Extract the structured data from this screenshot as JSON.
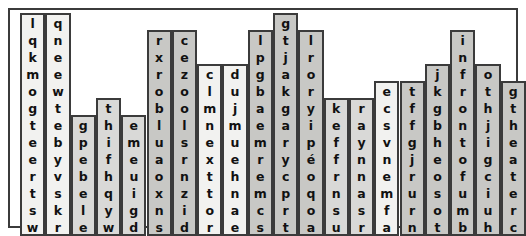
{
  "puzzle": {
    "title": "skyline-word-search",
    "rows": 13,
    "cols": 20,
    "cell_size": 17,
    "border_color": "#3b3b3b",
    "letter_color": "#111111",
    "background": "#ffffff",
    "shades": [
      "#f2f2f0",
      "#d9d9d7",
      "#c8c8c5",
      "#e8e8e6"
    ],
    "hidden_words": [
      "museum",
      "on the corner of",
      "across from",
      "restaurant",
      "in front of",
      "the theater"
    ],
    "columns": [
      {
        "index": 1,
        "top_row": 1,
        "shade": "#f2f2f0",
        "letters": [
          "l",
          "q",
          "k",
          "m",
          "o",
          "g",
          "t",
          "e",
          "e",
          "r",
          "t",
          "s",
          "w"
        ]
      },
      {
        "index": 2,
        "top_row": 1,
        "shade": "#f2f2f0",
        "letters": [
          "q",
          "n",
          "e",
          "e",
          "w",
          "t",
          "e",
          "b",
          "y",
          "v",
          "s",
          "k",
          "r"
        ]
      },
      {
        "index": 3,
        "top_row": 7,
        "shade": "#d9d9d7",
        "letters": [
          "g",
          "p",
          "e",
          "b",
          "e",
          "l",
          "e"
        ]
      },
      {
        "index": 4,
        "top_row": 6,
        "shade": "#d9d9d7",
        "letters": [
          "t",
          "h",
          "i",
          "f",
          "h",
          "q",
          "y",
          "w"
        ]
      },
      {
        "index": 5,
        "top_row": 7,
        "shade": "#d9d9d7",
        "letters": [
          "e",
          "m",
          "e",
          "u",
          "i",
          "g",
          "d"
        ]
      },
      {
        "index": 6,
        "top_row": 2,
        "shade": "#c8c8c5",
        "letters": [
          "r",
          "x",
          "r",
          "o",
          "b",
          "l",
          "u",
          "a",
          "o",
          "x",
          "n",
          "s"
        ]
      },
      {
        "index": 7,
        "top_row": 2,
        "shade": "#c8c8c5",
        "letters": [
          "c",
          "e",
          "z",
          "o",
          "o",
          "l",
          "s",
          "r",
          "n",
          "z",
          "i",
          "d"
        ]
      },
      {
        "index": 8,
        "top_row": 4,
        "shade": "#f2f2f0",
        "letters": [
          "c",
          "l",
          "m",
          "n",
          "e",
          "x",
          "t",
          "t",
          "o",
          "r"
        ]
      },
      {
        "index": 9,
        "top_row": 4,
        "shade": "#f2f2f0",
        "letters": [
          "d",
          "u",
          "j",
          "m",
          "u",
          "e",
          "h",
          "n",
          "a",
          "e"
        ]
      },
      {
        "index": 10,
        "top_row": 2,
        "shade": "#c8c8c5",
        "letters": [
          "l",
          "p",
          "g",
          "b",
          "a",
          "e",
          "m",
          "r",
          "e",
          "m",
          "c",
          "s"
        ]
      },
      {
        "index": 11,
        "top_row": 1,
        "shade": "#c8c8c5",
        "letters": [
          "g",
          "t",
          "j",
          "a",
          "k",
          "g",
          "a",
          "r",
          "y",
          "c",
          "p",
          "r",
          "t"
        ]
      },
      {
        "index": 12,
        "top_row": 2,
        "shade": "#c8c8c5",
        "letters": [
          "l",
          "r",
          "o",
          "r",
          "y",
          "i",
          "p",
          "é",
          "o",
          "q",
          "o",
          "a"
        ]
      },
      {
        "index": 13,
        "top_row": 6,
        "shade": "#d9d9d7",
        "letters": [
          "k",
          "e",
          "f",
          "f",
          "r",
          "n",
          "s",
          "u"
        ]
      },
      {
        "index": 14,
        "top_row": 6,
        "shade": "#d9d9d7",
        "letters": [
          "r",
          "a",
          "y",
          "n",
          "n",
          "a",
          "s",
          "r"
        ]
      },
      {
        "index": 15,
        "top_row": 5,
        "shade": "#f2f2f0",
        "letters": [
          "e",
          "c",
          "s",
          "v",
          "n",
          "e",
          "m",
          "f",
          "a"
        ]
      },
      {
        "index": 16,
        "top_row": 5,
        "shade": "#c8c8c5",
        "letters": [
          "t",
          "f",
          "f",
          "g",
          "j",
          "r",
          "u",
          "r",
          "n"
        ]
      },
      {
        "index": 17,
        "top_row": 4,
        "shade": "#c8c8c5",
        "letters": [
          "j",
          "k",
          "g",
          "b",
          "h",
          "e",
          "o",
          "s",
          "o",
          "t"
        ]
      },
      {
        "index": 18,
        "top_row": 2,
        "shade": "#c8c8c5",
        "letters": [
          "i",
          "n",
          "f",
          "r",
          "o",
          "n",
          "t",
          "o",
          "f",
          "u",
          "m",
          "b"
        ]
      },
      {
        "index": 19,
        "top_row": 4,
        "shade": "#c8c8c5",
        "letters": [
          "o",
          "t",
          "h",
          "j",
          "i",
          "g",
          "c",
          "i",
          "u",
          "h"
        ]
      },
      {
        "index": 20,
        "top_row": 5,
        "shade": "#c8c8c5",
        "letters": [
          "g",
          "t",
          "h",
          "e",
          "a",
          "t",
          "e",
          "r",
          "c"
        ]
      }
    ]
  }
}
